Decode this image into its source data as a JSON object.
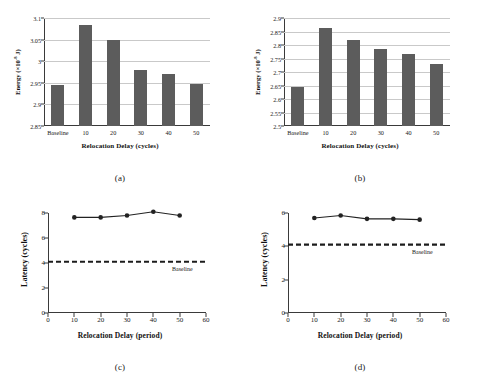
{
  "figure": {
    "panels": [
      {
        "caption": "(a)",
        "chart_data": {
          "type": "bar",
          "title": "",
          "categories": [
            "Baseline",
            "10",
            "20",
            "30",
            "40",
            "50"
          ],
          "values": [
            2.946,
            3.083,
            3.05,
            2.98,
            2.97,
            2.948
          ],
          "xlabel": "Relocation Delay (cycles)",
          "ylabel": "Energy (×10",
          "ylabel_exponent": "-8",
          "ylabel_suffix": " J)",
          "ylim": [
            2.85,
            3.1
          ],
          "yticks": [
            "2.85",
            "2.9",
            "2.95",
            "3",
            "3.05",
            "3.1"
          ],
          "ytick_values": [
            2.85,
            2.9,
            2.95,
            3.0,
            3.05,
            3.1
          ],
          "grid": true,
          "legend": "none",
          "bar_color": "#5c5c5c"
        }
      },
      {
        "caption": "(b)",
        "chart_data": {
          "type": "bar",
          "title": "",
          "categories": [
            "Baseline",
            "10",
            "20",
            "30",
            "40",
            "50"
          ],
          "values": [
            2.645,
            2.862,
            2.82,
            2.785,
            2.765,
            2.73
          ],
          "xlabel": "Relocation Delay (cycles)",
          "ylabel": "Energy (×10",
          "ylabel_exponent": "-8",
          "ylabel_suffix": " J)",
          "ylim": [
            2.5,
            2.9
          ],
          "yticks": [
            "2.5",
            "2.55",
            "2.6",
            "2.65",
            "2.7",
            "2.75",
            "2.8",
            "2.85",
            "2.9"
          ],
          "ytick_values": [
            2.5,
            2.55,
            2.6,
            2.65,
            2.7,
            2.75,
            2.8,
            2.85,
            2.9
          ],
          "grid": true,
          "legend": "none",
          "bar_color": "#5c5c5c"
        }
      },
      {
        "caption": "(c)",
        "chart_data": {
          "type": "line",
          "title": "",
          "x": [
            10,
            20,
            30,
            40,
            50
          ],
          "values": [
            7.65,
            7.65,
            7.8,
            8.1,
            7.8
          ],
          "baseline_value": 4.1,
          "baseline_label": "Baseline",
          "xlabel": "Relocation Delay (period)",
          "ylabel": "Latency (cycles)",
          "xlim": [
            0,
            60
          ],
          "ylim": [
            0,
            8
          ],
          "xticks": [
            "0",
            "10",
            "20",
            "30",
            "40",
            "50",
            "60"
          ],
          "xtick_values": [
            0,
            10,
            20,
            30,
            40,
            50,
            60
          ],
          "yticks": [
            "0",
            "2",
            "4",
            "6",
            "8"
          ],
          "ytick_values": [
            0,
            2,
            4,
            6,
            8
          ],
          "grid": false,
          "legend": "none",
          "line_color": "#222222",
          "marker": "circle"
        }
      },
      {
        "caption": "(d)",
        "chart_data": {
          "type": "line",
          "title": "",
          "x": [
            10,
            20,
            30,
            40,
            50
          ],
          "values": [
            5.7,
            5.85,
            5.65,
            5.65,
            5.6
          ],
          "baseline_value": 4.1,
          "baseline_label": "Baseline",
          "xlabel": "Relocation Delay (period)",
          "ylabel": "Latency (cycles)",
          "xlim": [
            0,
            60
          ],
          "ylim": [
            0,
            6
          ],
          "xticks": [
            "0",
            "10",
            "20",
            "30",
            "40",
            "50",
            "60"
          ],
          "xtick_values": [
            0,
            10,
            20,
            30,
            40,
            50,
            60
          ],
          "yticks": [
            "0",
            "2",
            "4",
            "6"
          ],
          "ytick_values": [
            0,
            2,
            4,
            6
          ],
          "grid": false,
          "legend": "none",
          "line_color": "#222222",
          "marker": "circle"
        }
      }
    ]
  }
}
